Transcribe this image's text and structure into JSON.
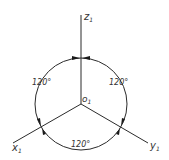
{
  "diagram": {
    "title": "",
    "origin": {
      "label": "o",
      "subscript": "1"
    },
    "axes": [
      {
        "id": "z",
        "label": "z",
        "subscript": "1"
      },
      {
        "id": "x",
        "label": "x",
        "subscript": "1"
      },
      {
        "id": "y",
        "label": "y",
        "subscript": "1"
      }
    ],
    "angles": [
      {
        "between": "z-x",
        "label": "120°"
      },
      {
        "between": "z-y",
        "label": "120°"
      },
      {
        "between": "x-y",
        "label": "120°"
      }
    ],
    "colors": {
      "line": "#2b2b2b",
      "text": "#333333",
      "background": "#ffffff"
    }
  }
}
